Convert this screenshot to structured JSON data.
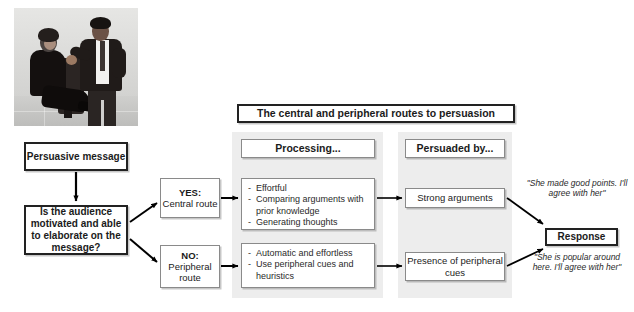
{
  "figure": {
    "title": "The central and peripheral routes to persuasion",
    "photo_alt": "two-people-conversation-photo"
  },
  "flow": {
    "message_box": "Persuasive message",
    "question_box": "Is the audience motivated and able to elaborate on the message?",
    "branches": [
      {
        "answer": "YES:",
        "route": "Central route"
      },
      {
        "answer": "NO:",
        "route": "Peripheral route"
      }
    ]
  },
  "columns": {
    "processing": {
      "header": "Processing...",
      "central_items": [
        "Effortful",
        "Comparing arguments with prior knowledge",
        "Generating thoughts"
      ],
      "peripheral_items": [
        "Automatic and effortless",
        "Use peripheral cues and heuristics"
      ]
    },
    "persuaded_by": {
      "header": "Persuaded by...",
      "central_label": "Strong arguments",
      "peripheral_label": "Presence of peripheral cues"
    },
    "response": {
      "header": "Response",
      "central_quote": "\"She made good points. I'll agree with her\"",
      "peripheral_quote": "\"She is popular around here. I'll agree with her\""
    }
  },
  "colors": {
    "panel_grey": "#ededed",
    "box_border": "#8a8a8a",
    "strong_border": "#222222",
    "arrow": "#000000",
    "background": "#ffffff"
  }
}
